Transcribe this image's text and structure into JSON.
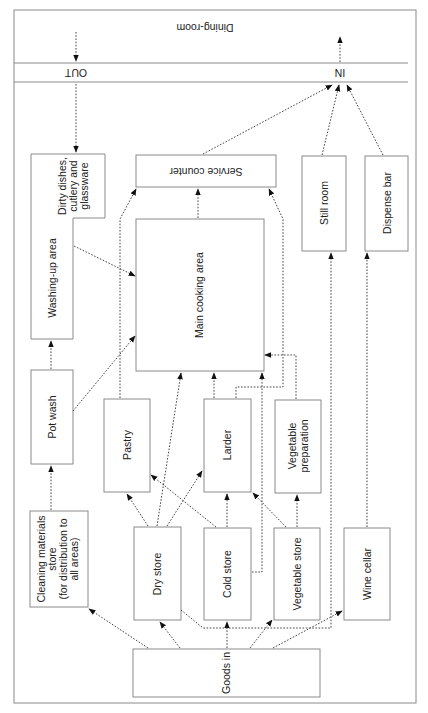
{
  "diagram": {
    "orientation_note": "rotated 180 degrees",
    "zones": {
      "dining_room": "Dining-room",
      "in_label": "IN",
      "out_label": "OUT"
    },
    "nodes": {
      "goods_in": "Goods in",
      "cleaning_store": [
        "Cleaning materials",
        "store",
        "(for distribution to",
        "all areas)"
      ],
      "dry_store": "Dry store",
      "cold_store": "Cold store",
      "vegetable_store": "Vegetable store",
      "wine_cellar": "Wine cellar",
      "pot_wash": "Pot wash",
      "pastry": "Pastry",
      "larder": "Larder",
      "vegetable_preparation": [
        "Vegetable",
        "preparation"
      ],
      "washing_up": "Washing-up area",
      "dirty_dishes": [
        "Dirty dishes,",
        "cutlery and",
        "glassware"
      ],
      "main_cooking": "Main cooking area",
      "service_counter": "Service counter",
      "still_room": "Still room",
      "dispense_bar": "Dispense bar"
    },
    "edges": [
      {
        "from": "Goods in",
        "to": "Cleaning materials store"
      },
      {
        "from": "Goods in",
        "to": "Dry store"
      },
      {
        "from": "Goods in",
        "to": "Cold store"
      },
      {
        "from": "Goods in",
        "to": "Vegetable store"
      },
      {
        "from": "Goods in",
        "to": "Wine cellar"
      },
      {
        "from": "Cleaning materials store",
        "to": "Pot wash"
      },
      {
        "from": "Pot wash",
        "to": "Washing-up area"
      },
      {
        "from": "Pot wash",
        "to": "Main cooking area"
      },
      {
        "from": "Dry store",
        "to": "Pastry"
      },
      {
        "from": "Dry store",
        "to": "Larder"
      },
      {
        "from": "Dry store",
        "to": "Main cooking area"
      },
      {
        "from": "Dry store",
        "to": "Still room"
      },
      {
        "from": "Cold store",
        "to": "Pastry"
      },
      {
        "from": "Cold store",
        "to": "Larder"
      },
      {
        "from": "Cold store",
        "to": "Main cooking area"
      },
      {
        "from": "Vegetable store",
        "to": "Larder"
      },
      {
        "from": "Vegetable store",
        "to": "Vegetable preparation"
      },
      {
        "from": "Vegetable preparation",
        "to": "Main cooking area"
      },
      {
        "from": "Larder",
        "to": "Main cooking area"
      },
      {
        "from": "Larder",
        "to": "Service counter"
      },
      {
        "from": "Pastry",
        "to": "Service counter"
      },
      {
        "from": "Washing-up area",
        "to": "Main cooking area"
      },
      {
        "from": "Main cooking area",
        "to": "Service counter"
      },
      {
        "from": "Wine cellar",
        "to": "Dispense bar"
      },
      {
        "from": "Service counter",
        "to": "IN"
      },
      {
        "from": "Still room",
        "to": "IN"
      },
      {
        "from": "Dispense bar",
        "to": "IN"
      },
      {
        "from": "IN",
        "to": "Dining-room"
      },
      {
        "from": "Dining-room",
        "to": "OUT"
      },
      {
        "from": "OUT",
        "to": "Dirty dishes, cutlery and glassware"
      }
    ]
  }
}
